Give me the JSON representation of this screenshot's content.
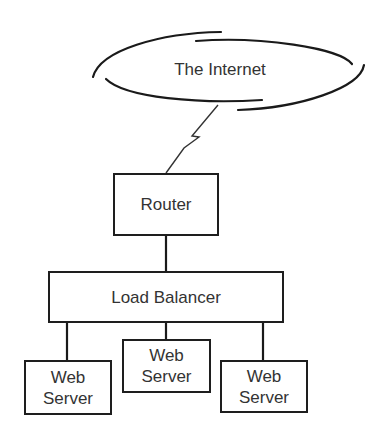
{
  "diagram": {
    "type": "network-topology",
    "cloud": {
      "label": "The Internet"
    },
    "router": {
      "label": "Router"
    },
    "load_balancer": {
      "label": "Load Balancer"
    },
    "servers": [
      {
        "line1": "Web",
        "line2": "Server"
      },
      {
        "line1": "Web",
        "line2": "Server"
      },
      {
        "line1": "Web",
        "line2": "Server"
      }
    ],
    "connections": [
      {
        "from": "The Internet",
        "to": "Router",
        "style": "lightning"
      },
      {
        "from": "Router",
        "to": "Load Balancer"
      },
      {
        "from": "Load Balancer",
        "to": "Web Server 1"
      },
      {
        "from": "Load Balancer",
        "to": "Web Server 2"
      },
      {
        "from": "Load Balancer",
        "to": "Web Server 3"
      }
    ]
  }
}
